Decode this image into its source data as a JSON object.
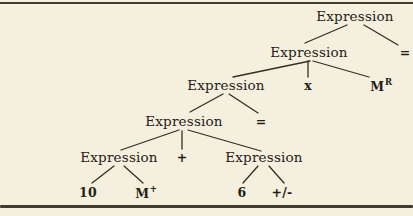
{
  "figure": {
    "background_color": "#f5efdd",
    "ink_color": "#26211a",
    "edge_color": "#332e26",
    "rule_color": "#3f3a32"
  },
  "tree": {
    "nodes": [
      {
        "id": "expr-root",
        "label": "Expression",
        "terminal": false,
        "x": 355,
        "y": 17
      },
      {
        "id": "eq-top",
        "label": "=",
        "terminal": true,
        "x": 405,
        "y": 53
      },
      {
        "id": "expr-1",
        "label": "Expression",
        "terminal": false,
        "x": 309,
        "y": 53
      },
      {
        "id": "times",
        "label": "x",
        "terminal": true,
        "x": 308,
        "y": 86
      },
      {
        "id": "mem-recall",
        "label": "M",
        "sup": "R",
        "terminal": true,
        "x": 381,
        "y": 86
      },
      {
        "id": "expr-2",
        "label": "Expression",
        "terminal": false,
        "x": 226,
        "y": 86
      },
      {
        "id": "eq-mid",
        "label": "=",
        "terminal": true,
        "x": 261,
        "y": 122
      },
      {
        "id": "expr-3",
        "label": "Expression",
        "terminal": false,
        "x": 184,
        "y": 122
      },
      {
        "id": "plus",
        "label": "+",
        "terminal": true,
        "x": 182,
        "y": 158
      },
      {
        "id": "expr-4",
        "label": "Expression",
        "terminal": false,
        "x": 119,
        "y": 158
      },
      {
        "id": "expr-5",
        "label": "Expression",
        "terminal": false,
        "x": 264,
        "y": 158
      },
      {
        "id": "num-10",
        "label": "10",
        "terminal": true,
        "x": 88,
        "y": 193
      },
      {
        "id": "mem-plus",
        "label": "M",
        "sup": "+",
        "terminal": true,
        "x": 146,
        "y": 193
      },
      {
        "id": "num-6",
        "label": "6",
        "terminal": true,
        "x": 242,
        "y": 193
      },
      {
        "id": "plus-minus",
        "label": "+/-",
        "terminal": true,
        "x": 282,
        "y": 193
      }
    ],
    "edges": [
      {
        "from": "expr-root",
        "to": "expr-1",
        "x1": 347,
        "y1": 25,
        "x2": 305,
        "y2": 43
      },
      {
        "from": "expr-root",
        "to": "eq-top",
        "x1": 364,
        "y1": 25,
        "x2": 398,
        "y2": 45
      },
      {
        "from": "expr-1",
        "to": "expr-2",
        "x1": 310,
        "y1": 61,
        "x2": 233,
        "y2": 77
      },
      {
        "from": "expr-1",
        "to": "times",
        "x1": 308,
        "y1": 61,
        "x2": 308,
        "y2": 77
      },
      {
        "from": "expr-1",
        "to": "mem-recall",
        "x1": 313,
        "y1": 61,
        "x2": 369,
        "y2": 77
      },
      {
        "from": "expr-2",
        "to": "expr-3",
        "x1": 223,
        "y1": 94,
        "x2": 190,
        "y2": 112
      },
      {
        "from": "expr-2",
        "to": "eq-mid",
        "x1": 229,
        "y1": 94,
        "x2": 258,
        "y2": 113
      },
      {
        "from": "expr-3",
        "to": "expr-4",
        "x1": 179,
        "y1": 130,
        "x2": 121,
        "y2": 150
      },
      {
        "from": "expr-3",
        "to": "plus",
        "x1": 182,
        "y1": 131,
        "x2": 182,
        "y2": 149
      },
      {
        "from": "expr-3",
        "to": "expr-5",
        "x1": 188,
        "y1": 130,
        "x2": 261,
        "y2": 151
      },
      {
        "from": "expr-4",
        "to": "num-10",
        "x1": 114,
        "y1": 166,
        "x2": 92,
        "y2": 183
      },
      {
        "from": "expr-4",
        "to": "mem-plus",
        "x1": 124,
        "y1": 166,
        "x2": 143,
        "y2": 183
      },
      {
        "from": "expr-5",
        "to": "num-6",
        "x1": 258,
        "y1": 166,
        "x2": 243,
        "y2": 183
      },
      {
        "from": "expr-5",
        "to": "plus-minus",
        "x1": 269,
        "y1": 166,
        "x2": 284,
        "y2": 183
      }
    ]
  }
}
